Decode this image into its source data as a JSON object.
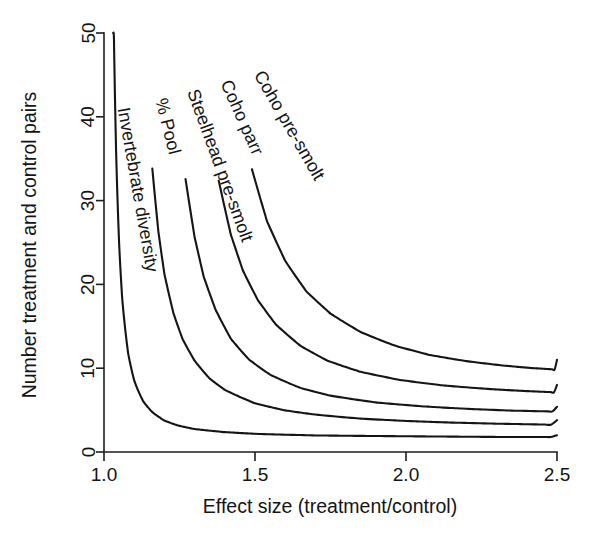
{
  "chart_data": {
    "type": "line",
    "title": "",
    "xlabel": "Effect size (treatment/control)",
    "ylabel": "Number treatment and control pairs",
    "xlim": [
      1.0,
      2.5
    ],
    "ylim": [
      0,
      50
    ],
    "xticks": [
      "1.0",
      "1.5",
      "2.0",
      "2.5"
    ],
    "xtick_values": [
      1.0,
      1.5,
      2.0,
      2.5
    ],
    "yticks": [
      "0",
      "10",
      "20",
      "30",
      "40",
      "50"
    ],
    "ytick_values": [
      0,
      10,
      20,
      30,
      40,
      50
    ],
    "grid": false,
    "legend": "inline-curve-labels",
    "series": [
      {
        "name": "Invertebrate diversity",
        "label": "Invertebrate diversity",
        "label_rotation": -80,
        "label_x": 1.045,
        "label_y": 41,
        "asymptote": 1.6,
        "scale": 0.055,
        "x": [
          1.03,
          1.04,
          1.05,
          1.06,
          1.08,
          1.1,
          1.13,
          1.16,
          1.2,
          1.25,
          1.3,
          1.4,
          1.5,
          1.7,
          1.9,
          2.1,
          2.3,
          2.5
        ],
        "y": [
          50.0,
          36.0,
          26.6,
          20.4,
          13.7,
          10.3,
          7.5,
          6.0,
          4.7,
          3.9,
          3.4,
          2.9,
          2.6,
          2.3,
          2.2,
          2.1,
          2.0,
          2.0
        ]
      },
      {
        "name": "% Pool",
        "label": "% Pool",
        "label_rotation": -76,
        "label_x": 1.17,
        "label_y": 42,
        "asymptote": 2.6,
        "scale": 0.46,
        "x": [
          1.16,
          1.18,
          1.2,
          1.23,
          1.26,
          1.3,
          1.35,
          1.4,
          1.5,
          1.6,
          1.7,
          1.85,
          2.0,
          2.15,
          2.3,
          2.5
        ],
        "y": [
          50.0,
          38.0,
          30.0,
          23.0,
          18.5,
          14.8,
          11.7,
          9.8,
          7.5,
          6.3,
          5.6,
          4.9,
          4.5,
          4.2,
          4.0,
          3.8
        ]
      },
      {
        "name": "Steelhead pre-smolt",
        "label": "Steelhead pre-smolt",
        "label_rotation": -70,
        "label_x": 1.275,
        "label_y": 43,
        "asymptote": 3.9,
        "scale": 1.05,
        "x": [
          1.27,
          1.3,
          1.33,
          1.37,
          1.42,
          1.48,
          1.55,
          1.65,
          1.75,
          1.9,
          2.05,
          2.2,
          2.35,
          2.5
        ],
        "y": [
          50.0,
          38.0,
          30.0,
          23.5,
          18.0,
          14.2,
          11.5,
          9.2,
          7.9,
          6.8,
          6.2,
          5.8,
          5.5,
          5.4
        ]
      },
      {
        "name": "Coho parr",
        "label": "Coho parr",
        "label_rotation": -66,
        "label_x": 1.385,
        "label_y": 44,
        "asymptote": 5.6,
        "scale": 1.78,
        "x": [
          1.38,
          1.42,
          1.46,
          1.51,
          1.57,
          1.65,
          1.74,
          1.85,
          1.98,
          2.12,
          2.28,
          2.4,
          2.5
        ],
        "y": [
          50.0,
          38.5,
          31.0,
          25.0,
          20.2,
          16.2,
          13.4,
          11.4,
          10.0,
          9.1,
          8.5,
          8.2,
          8.0
        ]
      },
      {
        "name": "Coho pre-smolt",
        "label": "Coho pre-smolt",
        "label_rotation": -60,
        "label_x": 1.495,
        "label_y": 45,
        "asymptote": 7.5,
        "scale": 3.1,
        "x": [
          1.49,
          1.54,
          1.6,
          1.67,
          1.75,
          1.85,
          1.96,
          2.08,
          2.2,
          2.32,
          2.42,
          2.5
        ],
        "y": [
          50.0,
          39.0,
          31.0,
          25.0,
          20.8,
          17.4,
          15.0,
          13.3,
          12.3,
          11.6,
          11.2,
          11.0
        ]
      }
    ]
  },
  "colors": {
    "axis": "#1d1d1d",
    "curve": "#151515",
    "background": "#ffffff"
  }
}
